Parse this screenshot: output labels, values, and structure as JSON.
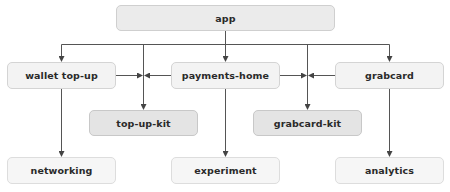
{
  "diagram": {
    "type": "module dependency graph",
    "nodes": {
      "app": {
        "label": "app",
        "tier": "root"
      },
      "wallet_topup": {
        "label": "wallet top-up",
        "tier": "feature"
      },
      "payments_home": {
        "label": "payments-home",
        "tier": "feature"
      },
      "grabcard": {
        "label": "grabcard",
        "tier": "feature"
      },
      "topup_kit": {
        "label": "top-up-kit",
        "tier": "kit"
      },
      "grabcard_kit": {
        "label": "grabcard-kit",
        "tier": "kit"
      },
      "networking": {
        "label": "networking",
        "tier": "base"
      },
      "experiment": {
        "label": "experiment",
        "tier": "base"
      },
      "analytics": {
        "label": "analytics",
        "tier": "base"
      }
    },
    "edges": [
      {
        "from": "app",
        "to": "wallet top-up"
      },
      {
        "from": "app",
        "to": "top-up-kit"
      },
      {
        "from": "app",
        "to": "payments-home"
      },
      {
        "from": "app",
        "to": "grabcard-kit"
      },
      {
        "from": "app",
        "to": "grabcard"
      },
      {
        "from": "wallet top-up",
        "to": "top-up-kit"
      },
      {
        "from": "payments-home",
        "to": "top-up-kit"
      },
      {
        "from": "payments-home",
        "to": "grabcard-kit"
      },
      {
        "from": "grabcard",
        "to": "grabcard-kit"
      },
      {
        "from": "wallet top-up",
        "to": "networking"
      },
      {
        "from": "payments-home",
        "to": "experiment"
      },
      {
        "from": "grabcard",
        "to": "analytics"
      }
    ],
    "colors": {
      "line": "#555555",
      "root_fill": "#ebebeb",
      "module_fill": "#f3f3f3",
      "kit_fill": "#e4e4e4",
      "leaf_fill": "#f6f6f6",
      "border": "#d4d4d4",
      "text": "#2a2a2a"
    }
  }
}
